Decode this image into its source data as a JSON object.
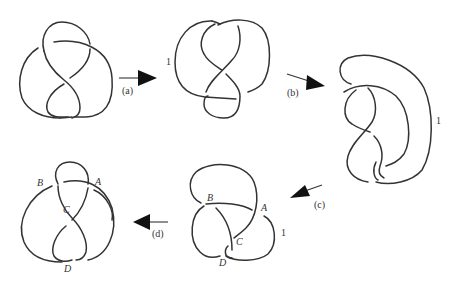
{
  "figure": {
    "stroke_color": "#333333",
    "arrow_color": "#111111"
  },
  "steps": [
    {
      "id": "knot-1",
      "label": ""
    },
    {
      "id": "knot-2",
      "marker": "1"
    },
    {
      "id": "knot-3",
      "marker": "1"
    },
    {
      "id": "knot-4",
      "marker": "1",
      "crossings": [
        "A",
        "B",
        "C",
        "D"
      ]
    },
    {
      "id": "knot-5",
      "crossings": [
        "A",
        "B",
        "C",
        "D"
      ]
    }
  ],
  "arrows": {
    "a": "(a)",
    "b": "(b)",
    "c": "(c)",
    "d": "(d)"
  },
  "labels": {
    "one": "1",
    "A": "A",
    "B": "B",
    "C": "C",
    "D": "D"
  }
}
